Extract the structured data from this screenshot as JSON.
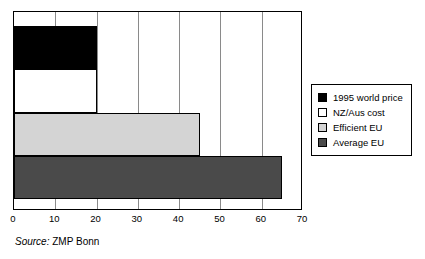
{
  "chart_data": {
    "type": "bar",
    "orientation": "horizontal",
    "title": "",
    "xlabel": "",
    "ylabel": "",
    "xlim": [
      0,
      70
    ],
    "xticks": [
      "0",
      "10",
      "20",
      "30",
      "40",
      "50",
      "60",
      "70"
    ],
    "grid": true,
    "legend_position": "right",
    "categories": [
      "1995 world price",
      "NZ/Aus cost",
      "Efficient EU",
      "Average EU"
    ],
    "values": [
      20,
      20,
      45,
      65
    ],
    "colors": [
      "#000000",
      "#ffffff",
      "#d4d4d4",
      "#4a4a4a"
    ],
    "bars": [
      {
        "label": "1995 world price",
        "value": 20,
        "color": "#000000",
        "swatch": "sw-black"
      },
      {
        "label": "NZ/Aus cost",
        "value": 20,
        "color": "#ffffff",
        "swatch": "sw-white"
      },
      {
        "label": "Efficient EU",
        "value": 45,
        "color": "#d4d4d4",
        "swatch": "sw-ltgray"
      },
      {
        "label": "Average EU",
        "value": 65,
        "color": "#4a4a4a",
        "swatch": "sw-dkgray"
      }
    ]
  },
  "legend": {
    "items": [
      {
        "label": "1995 world price",
        "swatch": "sw-black"
      },
      {
        "label": "NZ/Aus cost",
        "swatch": "sw-white"
      },
      {
        "label": "Efficient EU",
        "swatch": "sw-ltgray"
      },
      {
        "label": "Average EU",
        "swatch": "sw-dkgray"
      }
    ]
  },
  "source": {
    "label": "Source:",
    "value": "ZMP Bonn"
  }
}
